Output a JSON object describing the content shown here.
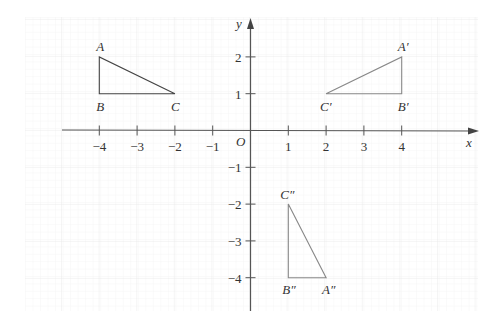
{
  "diagram": {
    "type": "coordinate-plane-transformations",
    "origin_label": "O",
    "axes": {
      "x_label": "x",
      "y_label": "y",
      "x_ticks": [
        {
          "value": -4,
          "label": "−4"
        },
        {
          "value": -3,
          "label": "−3"
        },
        {
          "value": -2,
          "label": "−2"
        },
        {
          "value": -1,
          "label": "−1"
        },
        {
          "value": 1,
          "label": "1"
        },
        {
          "value": 2,
          "label": "2"
        },
        {
          "value": 3,
          "label": "3"
        },
        {
          "value": 4,
          "label": "4"
        }
      ],
      "y_ticks": [
        {
          "value": 2,
          "label": "2"
        },
        {
          "value": 1,
          "label": "1"
        },
        {
          "value": -1,
          "label": "−1"
        },
        {
          "value": -2,
          "label": "−2"
        },
        {
          "value": -3,
          "label": "−3"
        },
        {
          "value": -4,
          "label": "−4"
        }
      ]
    },
    "triangles": [
      {
        "name": "ABC",
        "stroke": "#444444",
        "vertices": [
          {
            "label": "A",
            "x": -4,
            "y": 2
          },
          {
            "label": "B",
            "x": -4,
            "y": 1
          },
          {
            "label": "C",
            "x": -2,
            "y": 1
          }
        ]
      },
      {
        "name": "A'B'C'",
        "stroke": "#888888",
        "vertices": [
          {
            "label": "A′",
            "x": 4,
            "y": 2
          },
          {
            "label": "B′",
            "x": 4,
            "y": 1
          },
          {
            "label": "C′",
            "x": 2,
            "y": 1
          }
        ]
      },
      {
        "name": "A''B''C''",
        "stroke": "#888888",
        "vertices": [
          {
            "label": "A″",
            "x": 2,
            "y": -4
          },
          {
            "label": "B″",
            "x": 1,
            "y": -4
          },
          {
            "label": "C″",
            "x": 1,
            "y": -2
          }
        ]
      }
    ],
    "colors": {
      "axis": "#555555",
      "grid_minor": "#f1f1f1",
      "grid_major": "#e4e4e4",
      "text": "#333333"
    }
  }
}
